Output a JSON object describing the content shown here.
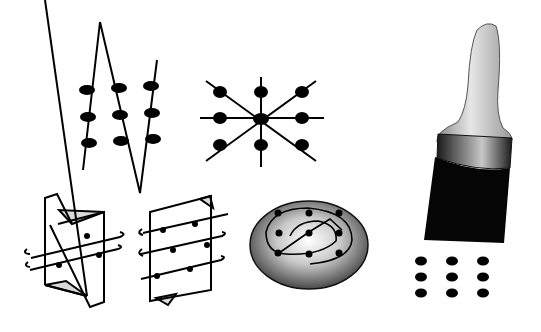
{
  "figure": {
    "background": "#ffffff",
    "ink": "#000000",
    "panels": [
      {
        "id": "zigzag-dots",
        "label": "Zigzag line through 3x3 dot grid",
        "dots_rows": 3,
        "dots_cols": 3
      },
      {
        "id": "radial-star",
        "label": "Radial star with central node and 8 outer nodes",
        "outer_nodes": 8
      },
      {
        "id": "twisted-sheet-left",
        "label": "Twisted sheet with 2 helical lines",
        "lines": 2
      },
      {
        "id": "twisted-sheet-right",
        "label": "Parallelogram sheet with 3 helical lines",
        "lines": 3
      },
      {
        "id": "spiral-disc",
        "label": "Shaded ellipse with spiral and nodes",
        "nodes": 9
      },
      {
        "id": "paint-brush",
        "label": "Paint brush above 3x3 dot grid",
        "dots_rows": 3,
        "dots_cols": 3
      }
    ],
    "colors": {
      "ink": "#000000",
      "fold_shade": "#d9d9d9",
      "disc_outer": "#3a3a3a",
      "disc_inner": "#ffffff",
      "brush_handle": "#c8c8c8",
      "ferrule": "#2a2a2a",
      "bristles": "#050505"
    }
  }
}
